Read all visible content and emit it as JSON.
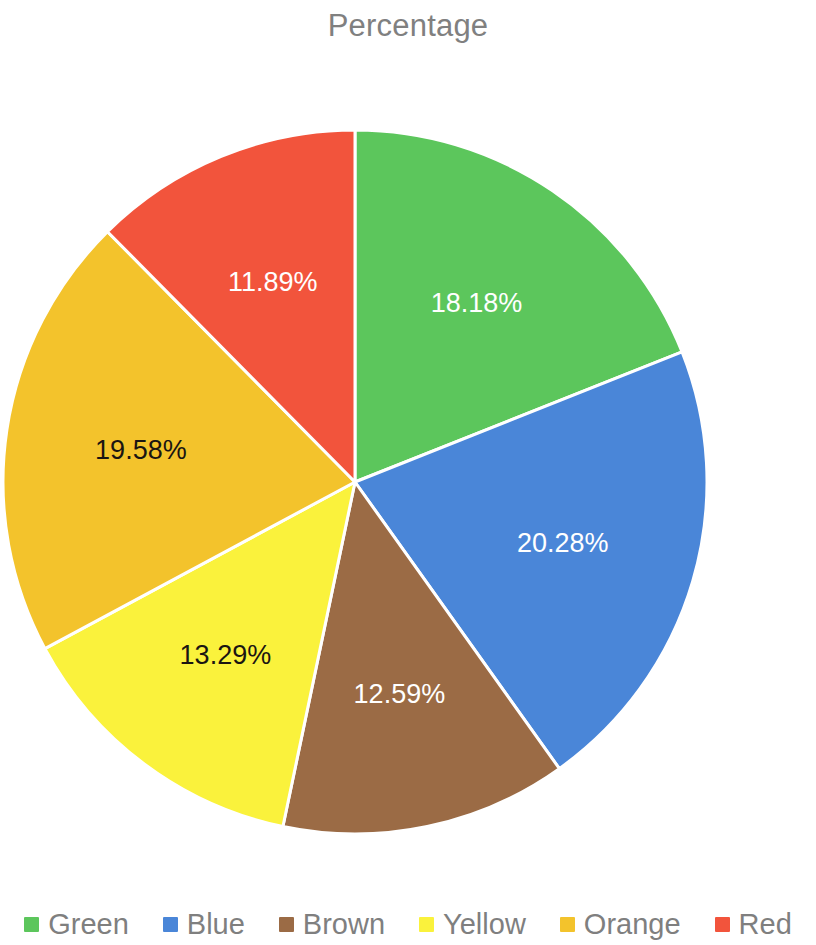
{
  "chart_data": {
    "type": "pie",
    "title": "Percentage",
    "xlabel": "",
    "ylabel": "",
    "legend_position": "bottom",
    "grid": false,
    "labels_format": "percent",
    "categories": [
      "Green",
      "Blue",
      "Brown",
      "Yellow",
      "Orange",
      "Red"
    ],
    "values": [
      18.18,
      20.28,
      12.59,
      13.29,
      19.58,
      11.89
    ],
    "value_labels": [
      "18.18%",
      "20.28%",
      "12.59%",
      "13.29%",
      "19.58%",
      "11.89%"
    ],
    "colors": [
      "#5cc65c",
      "#4a86d8",
      "#9b6b45",
      "#faf23c",
      "#f3c32c",
      "#f2543c"
    ],
    "label_text_colors": [
      "#ffffff",
      "#ffffff",
      "#ffffff",
      "#1a1512",
      "#1a1512",
      "#ffffff"
    ],
    "slices": [
      {
        "name": "Green",
        "value": 18.18,
        "label": "18.18%",
        "color": "#5cc65c",
        "label_color": "light"
      },
      {
        "name": "Blue",
        "value": 20.28,
        "label": "20.28%",
        "color": "#4a86d8",
        "label_color": "light"
      },
      {
        "name": "Brown",
        "value": 12.59,
        "label": "12.59%",
        "color": "#9b6b45",
        "label_color": "light"
      },
      {
        "name": "Yellow",
        "value": 13.29,
        "label": "13.29%",
        "color": "#faf23c",
        "label_color": "dark"
      },
      {
        "name": "Orange",
        "value": 19.58,
        "label": "19.58%",
        "color": "#f3c32c",
        "label_color": "dark"
      },
      {
        "name": "Red",
        "value": 11.89,
        "label": "11.89%",
        "color": "#f2543c",
        "label_color": "light"
      }
    ]
  },
  "legend": {
    "items": [
      {
        "label": "Green",
        "color": "#5cc65c"
      },
      {
        "label": "Blue",
        "color": "#4a86d8"
      },
      {
        "label": "Brown",
        "color": "#9b6b45"
      },
      {
        "label": "Yellow",
        "color": "#faf23c"
      },
      {
        "label": "Orange",
        "color": "#f3c32c"
      },
      {
        "label": "Red",
        "color": "#f2543c"
      }
    ]
  },
  "style": {
    "title_color": "#808080",
    "legend_text_color": "#7f7f7f",
    "background": "#ffffff",
    "slice_border": "#ffffff"
  }
}
